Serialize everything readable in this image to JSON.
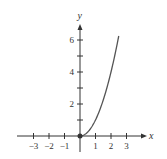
{
  "chart_data": {
    "type": "line",
    "title": "",
    "xlabel": "x",
    "ylabel": "y",
    "function": "y = x^2, x >= 0",
    "x": [
      0,
      0.5,
      1,
      1.5,
      2,
      2.5
    ],
    "series": [
      {
        "name": "curve",
        "values": [
          0,
          0.25,
          1,
          2.25,
          4,
          6.25
        ]
      }
    ],
    "start_point": {
      "x": 0,
      "y": 0,
      "filled": true
    },
    "xticks": [
      -3,
      -2,
      -1,
      1,
      2,
      3
    ],
    "xtick_labels": [
      "−3",
      "−2",
      "−1",
      "1",
      "2",
      "3"
    ],
    "yticks": [
      1,
      2,
      3,
      4,
      5,
      6
    ],
    "ytick_labels": {
      "2": "2",
      "4": "4",
      "6": "6"
    },
    "xlim": [
      -3.6,
      4
    ],
    "ylim": [
      -1,
      7
    ],
    "grid": false,
    "legend": "none",
    "colors": {
      "axis": "#333333",
      "curve": "#555555"
    }
  }
}
